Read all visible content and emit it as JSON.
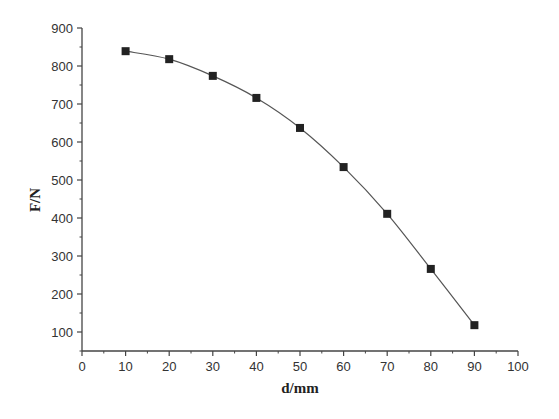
{
  "chart_data": {
    "type": "line",
    "title": "",
    "xlabel": "d/mm",
    "ylabel": "F/N",
    "x": [
      10,
      20,
      30,
      40,
      50,
      60,
      70,
      80,
      90
    ],
    "series": [
      {
        "name": "F",
        "values": [
          839,
          818,
          774,
          716,
          637,
          534,
          411,
          266,
          118
        ],
        "marker": "square",
        "color": "#222222"
      }
    ],
    "xlim": [
      0,
      100
    ],
    "ylim": [
      50,
      900
    ],
    "xticks": [
      0,
      10,
      20,
      30,
      40,
      50,
      60,
      70,
      80,
      90,
      100
    ],
    "yticks": [
      100,
      200,
      300,
      400,
      500,
      600,
      700,
      800,
      900
    ],
    "grid": false,
    "legend": null
  },
  "colors": {
    "axis": "#444444",
    "line": "#555555",
    "marker": "#222222"
  }
}
